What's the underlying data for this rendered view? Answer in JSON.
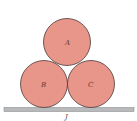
{
  "diagram": {
    "fill_color": "#e9968a",
    "stroke_color": "#4a3a38",
    "floor_color": "#b7b9bb",
    "circles": [
      {
        "label": "A",
        "cx": 67,
        "cy": 42,
        "r": 23.5
      },
      {
        "label": "B",
        "cx": 44,
        "cy": 84,
        "r": 23.5
      },
      {
        "label": "C",
        "cx": 91,
        "cy": 84,
        "r": 23.5
      }
    ],
    "floor": {
      "label": "J",
      "x": 4,
      "y": 107,
      "width": 130,
      "height": 4
    }
  }
}
